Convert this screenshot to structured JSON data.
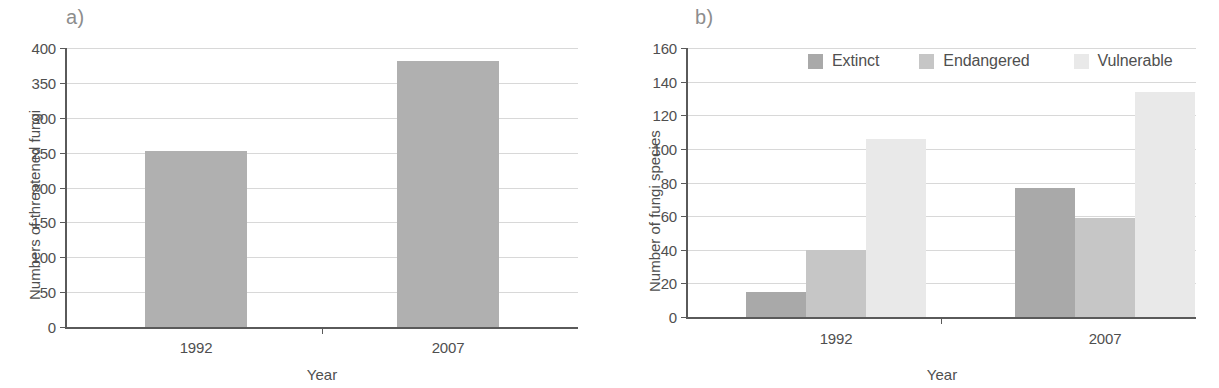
{
  "figure": {
    "panels": [
      {
        "label": "a)",
        "chart_data": {
          "type": "bar",
          "title": "",
          "xlabel": "Year",
          "ylabel": "Numbers of threatened fungi",
          "categories": [
            "1992",
            "2007"
          ],
          "values": [
            252,
            381
          ],
          "ylim": [
            0,
            400
          ],
          "yticks": [
            0,
            50,
            100,
            150,
            200,
            250,
            300,
            350,
            400
          ],
          "ytick_labels": [
            "0",
            "50",
            "100",
            "150",
            "200",
            "250",
            "300",
            "350",
            "400"
          ],
          "grid": true,
          "legend": "none",
          "bar_color": "#b0b0b0"
        }
      },
      {
        "label": "b)",
        "chart_data": {
          "type": "bar",
          "title": "",
          "xlabel": "Year",
          "ylabel": "Number of fungi species",
          "categories": [
            "1992",
            "2007"
          ],
          "series": [
            {
              "name": "Extinct",
              "values": [
                15,
                77
              ],
              "color": "#a9a9a9"
            },
            {
              "name": "Endangered",
              "values": [
                40,
                59
              ],
              "color": "#c6c6c6"
            },
            {
              "name": "Vulnerable",
              "values": [
                106,
                134
              ],
              "color": "#e9e9e9"
            }
          ],
          "ylim": [
            0,
            160
          ],
          "yticks": [
            0,
            20,
            40,
            60,
            80,
            100,
            120,
            140,
            160
          ],
          "ytick_labels": [
            "0",
            "20",
            "40",
            "60",
            "80",
            "100",
            "120",
            "140",
            "160"
          ],
          "grid": true,
          "legend": "top-center"
        }
      }
    ]
  }
}
